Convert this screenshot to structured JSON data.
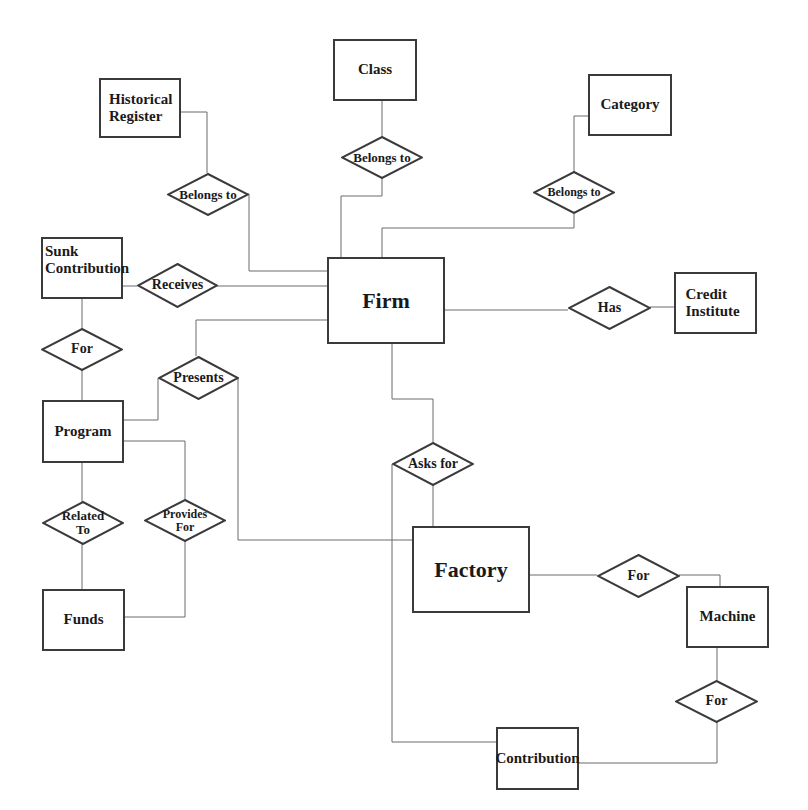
{
  "diagram": {
    "type": "entity-relationship",
    "entities": {
      "historical_register": "Historical Register",
      "class": "Class",
      "category": "Category",
      "sunk_contribution": "Sunk Contribution",
      "firm": "Firm",
      "credit_institute": "Credit Institute",
      "program": "Program",
      "funds": "Funds",
      "factory": "Factory",
      "machine": "Machine",
      "contribution": "Contribution"
    },
    "relationships": {
      "hr_belongs_to": "Belongs to",
      "class_belongs_to": "Belongs to",
      "category_belongs_to": "Belongs to",
      "receives": "Receives",
      "has": "Has",
      "sunk_for": "For",
      "presents": "Presents",
      "asks_for": "Asks for",
      "related_to": "Related To",
      "provides_for": "Provides For",
      "factory_for": "For",
      "machine_for": "For"
    },
    "connections": [
      [
        "Historical Register",
        "Belongs to",
        "Firm"
      ],
      [
        "Class",
        "Belongs to",
        "Firm"
      ],
      [
        "Category",
        "Belongs to",
        "Firm"
      ],
      [
        "Firm",
        "Receives",
        "Sunk Contribution"
      ],
      [
        "Firm",
        "Has",
        "Credit Institute"
      ],
      [
        "Sunk Contribution",
        "For",
        "Program"
      ],
      [
        "Firm",
        "Presents",
        "Program"
      ],
      [
        "Presents",
        "",
        "Factory"
      ],
      [
        "Firm",
        "Asks for",
        "Factory"
      ],
      [
        "Asks for",
        "",
        "Contribution"
      ],
      [
        "Program",
        "Related To",
        "Funds"
      ],
      [
        "Program",
        "Provides For",
        "Funds"
      ],
      [
        "Factory",
        "For",
        "Machine"
      ],
      [
        "Machine",
        "For",
        "Contribution"
      ]
    ],
    "colors": {
      "stroke": "#3a3a3a",
      "line": "#6a6a6a",
      "text": "#1a1a1a",
      "background": "#ffffff"
    }
  }
}
